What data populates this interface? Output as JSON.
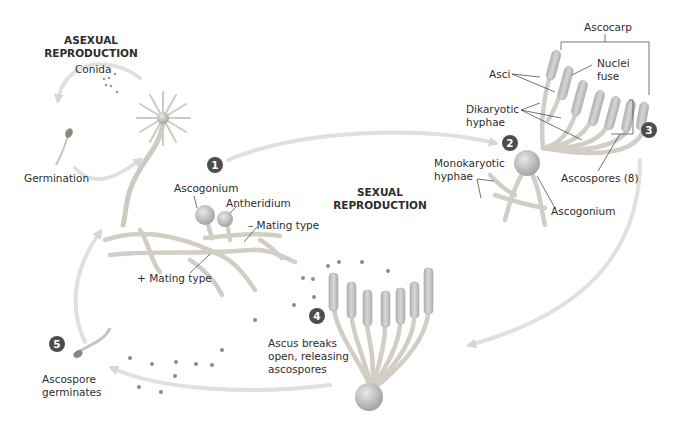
{
  "colors": {
    "hypha_fill": "#ebe8e2",
    "hypha_stroke": "#c9c4bb",
    "cell_fill": "#bcbcbc",
    "ascus_fill": "#c5c5c5",
    "spore": "#8d8d8d",
    "arrow": "#dcdcdc",
    "step_badge": "#4d4d4d",
    "leader_line": "#3a3a3a"
  },
  "sections": {
    "asexual": {
      "line1": "ASEXUAL",
      "line2": "REPRODUCTION"
    },
    "sexual": {
      "line1": "SEXUAL",
      "line2": "REPRODUCTION"
    }
  },
  "steps": [
    {
      "number": "1"
    },
    {
      "number": "2"
    },
    {
      "number": "3"
    },
    {
      "number": "4"
    },
    {
      "number": "5"
    }
  ],
  "labels": {
    "conida": "Conida",
    "germination": "Germination",
    "ascogonium_1": "Ascogonium",
    "antheridium": "Antheridium",
    "minus_mating": "– Mating type",
    "plus_mating": "+ Mating type",
    "ascocarp": "Ascocarp",
    "asci": "Asci",
    "nuclei_fuse_1": "Nuclei",
    "nuclei_fuse_2": "fuse",
    "dikaryotic_1": "Dikaryotic",
    "dikaryotic_2": "hyphae",
    "monokaryotic_1": "Monokaryotic",
    "monokaryotic_2": "hyphae",
    "ascospores": "Ascospores (8)",
    "ascogonium_2": "Ascogonium",
    "ascus_breaks_1": "Ascus breaks",
    "ascus_breaks_2": "open, releasing",
    "ascus_breaks_3": "ascospores",
    "ascospore_germ_1": "Ascospore",
    "ascospore_germ_2": "germinates"
  }
}
